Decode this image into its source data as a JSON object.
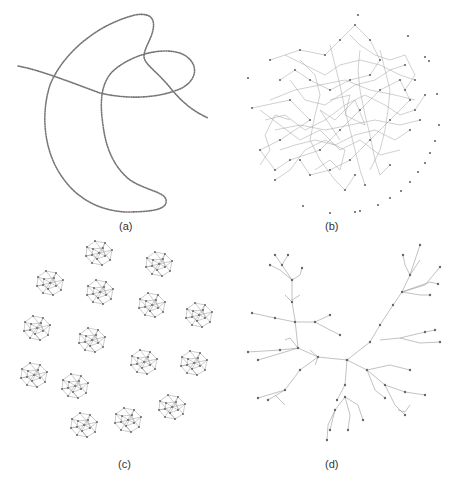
{
  "figure": {
    "panels": [
      {
        "id": "a",
        "label": "(a)",
        "description": "Long chain (path graph) layout drawn as dotted curves"
      },
      {
        "id": "b",
        "label": "(b)",
        "description": "Dense random network with scattered isolated nodes"
      },
      {
        "id": "c",
        "label": "(c)",
        "description": "Fifteen small disconnected clustered components"
      },
      {
        "id": "d",
        "label": "(d)",
        "description": "Tree layout with radial branches"
      }
    ],
    "colors": {
      "background": "#ffffff",
      "node": "#666666",
      "edge": "#9a9a9a",
      "label": "#333333"
    }
  }
}
